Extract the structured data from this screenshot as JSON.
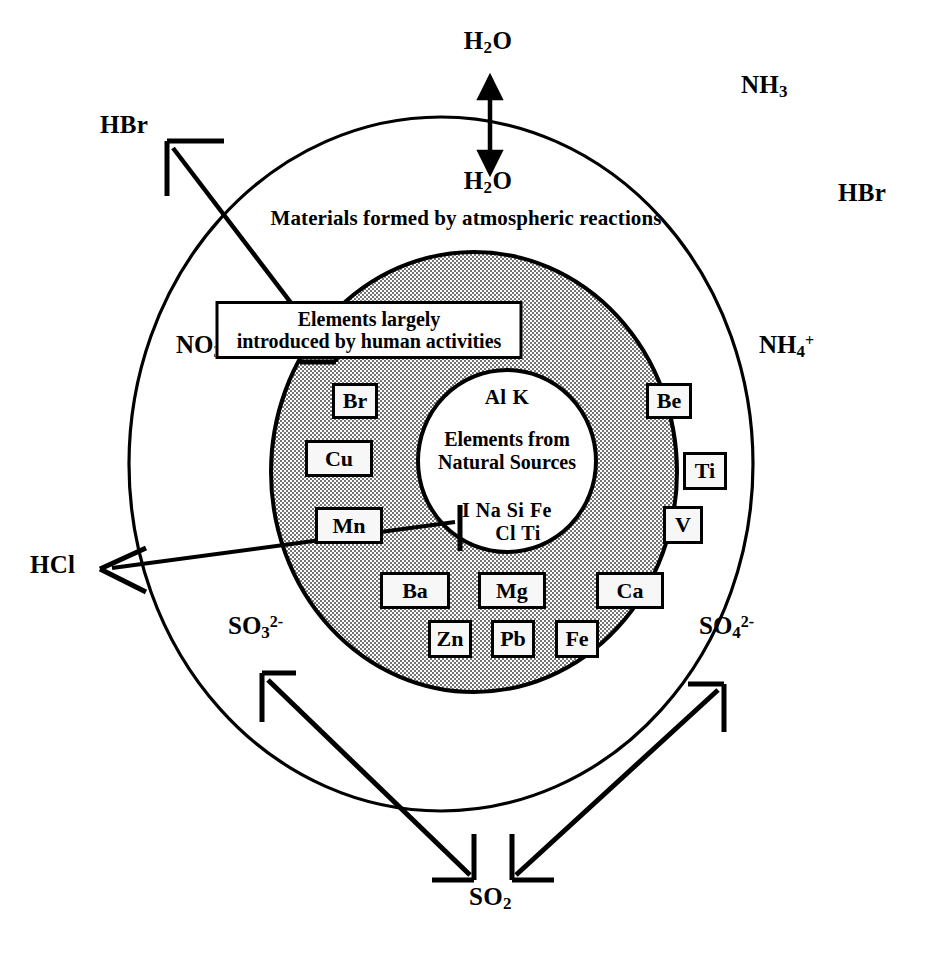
{
  "figure": {
    "type": "concentric-venn-diagram",
    "background_color": "#ffffff",
    "stipple_fill_color": "#d9d9d9",
    "stroke_color": "#000000"
  },
  "rings": {
    "outer_caption": "Materials formed by atmospheric reactions",
    "middle_caption_line1": "Elements largely",
    "middle_caption_line2": "introduced by human activities",
    "core_caption_line1": "Elements from",
    "core_caption_line2": "Natural Sources"
  },
  "core_elements": {
    "top_row": "Al   K",
    "bottom_row_1": "I   Na   Si   Fe",
    "bottom_row_2": "Cl   Ti"
  },
  "anthropogenic_elements": [
    {
      "symbol": "Br"
    },
    {
      "symbol": "Cu"
    },
    {
      "symbol": "Mn"
    },
    {
      "symbol": "Ba"
    },
    {
      "symbol": "Zn"
    },
    {
      "symbol": "Pb"
    },
    {
      "symbol": "Mg"
    },
    {
      "symbol": "Fe"
    },
    {
      "symbol": "Ca"
    },
    {
      "symbol": "V"
    },
    {
      "symbol": "Ti"
    },
    {
      "symbol": "Be"
    }
  ],
  "exterior_species": [
    {
      "name": "water-vapor-out",
      "formula": "H",
      "sub": "2",
      "tail": "O",
      "position": "top-outside"
    },
    {
      "name": "water-vapor-in",
      "formula": "H",
      "sub": "2",
      "tail": "O",
      "position": "top-inside"
    },
    {
      "name": "ammonia",
      "formula": "NH",
      "sub": "3",
      "tail": "",
      "position": "top-right-outside"
    },
    {
      "name": "hydrogen-bromide-outer-right",
      "formula": "HBr",
      "sub": "",
      "tail": "",
      "position": "right-outside"
    },
    {
      "name": "hydrogen-bromide-arrow-left",
      "formula": "HBr",
      "sub": "",
      "tail": "",
      "position": "top-left-outside"
    },
    {
      "name": "hydrogen-chloride",
      "formula": "HCl",
      "sub": "",
      "tail": "",
      "position": "left-outside"
    },
    {
      "name": "sulfur-dioxide",
      "formula": "SO",
      "sub": "2",
      "tail": "",
      "position": "bottom-outside"
    }
  ],
  "interior_ions": [
    {
      "name": "nitrate",
      "base": "NO",
      "sub": "3",
      "sup": "-",
      "position": "left"
    },
    {
      "name": "ammonium",
      "base": "NH",
      "sub": "4",
      "sup": "+",
      "position": "right"
    },
    {
      "name": "sulfite",
      "base": "SO",
      "sub": "3",
      "sup": "2-",
      "position": "bottom-left"
    },
    {
      "name": "sulfate",
      "base": "SO",
      "sub": "4",
      "sup": "2-",
      "position": "bottom-right"
    }
  ],
  "arrows": [
    {
      "name": "h2o-exchange-arrow",
      "kind": "double-headed-vertical",
      "description": "H2O exchange across outer boundary"
    },
    {
      "name": "hbr-emission-arrow",
      "kind": "single-headed",
      "description": "from Br chip outward to HBr, upper-left"
    },
    {
      "name": "hcl-emission-arrow",
      "kind": "single-headed",
      "description": "from core Cl outward to HCl, left"
    },
    {
      "name": "so3-emission-arrow",
      "kind": "single-headed",
      "description": "from SO2 up-left to SO3 2-"
    },
    {
      "name": "so4-emission-arrow",
      "kind": "single-headed",
      "description": "from SO2 up-right to SO4 2-"
    }
  ]
}
